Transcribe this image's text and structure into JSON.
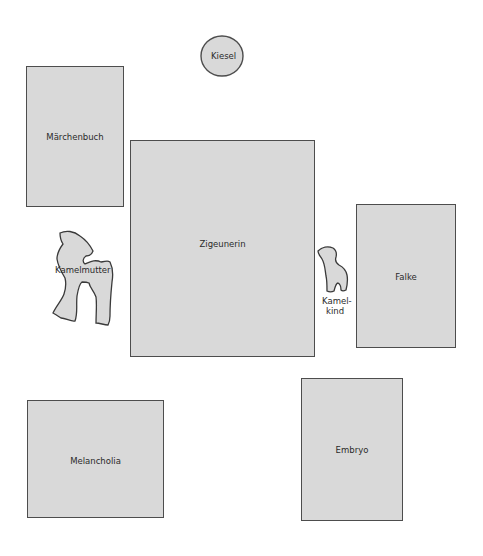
{
  "diagram": {
    "fill_color": "#d9d9d9",
    "stroke_color": "#4d4d4d",
    "elements": {
      "kiesel": {
        "label": "Kiesel",
        "shape": "circle"
      },
      "maerchenbuch": {
        "label": "Märchenbuch",
        "shape": "rectangle"
      },
      "zigeunerin": {
        "label": "Zigeunerin",
        "shape": "rectangle"
      },
      "kamelmutter": {
        "label": "Kamelmutter",
        "shape": "camel-silhouette"
      },
      "kamelkind": {
        "label_line1": "Kamel-",
        "label_line2": "kind",
        "shape": "camel-silhouette"
      },
      "falke": {
        "label": "Falke",
        "shape": "rectangle"
      },
      "melancholia": {
        "label": "Melancholia",
        "shape": "rectangle"
      },
      "embryo": {
        "label": "Embryo",
        "shape": "rectangle"
      }
    }
  }
}
